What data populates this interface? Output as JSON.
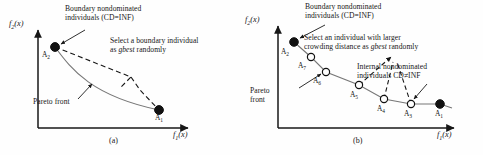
{
  "figure": {
    "kind": "two-panel-schematic-diagram",
    "width": 483,
    "height": 155,
    "background": "#ffffff",
    "ink_color": "#171717"
  },
  "panel_a": {
    "caption": "(a)",
    "axes": {
      "y_label_f": "f",
      "y_label_sub": "2",
      "y_label_arg": "(x)",
      "x_label_f": "f",
      "x_label_sub": "1",
      "x_label_arg": "(x)"
    },
    "annotations": {
      "boundary_line1": "Boundary nondominated",
      "boundary_line2": "individuals (CD=INF)",
      "select_line1": "Select a boundary individual",
      "select_line2_pre": "as ",
      "select_line2_ital": "gbest",
      "select_line2_post": " randomly",
      "pareto_front": "Pareto front"
    },
    "points": [
      {
        "id": "A2",
        "label_f": "A",
        "label_sub": "2",
        "marker": "filled",
        "x": 55,
        "y": 47
      },
      {
        "id": "A1",
        "label_f": "A",
        "label_sub": "1",
        "marker": "filled",
        "x": 159,
        "y": 110
      }
    ]
  },
  "panel_b": {
    "caption": "(b)",
    "axes": {
      "y_label_f": "f",
      "y_label_sub": "2",
      "y_label_arg": "(x)",
      "x_label_f": "f",
      "x_label_sub": "1",
      "x_label_arg": "(x)"
    },
    "annotations": {
      "boundary_line1": "Boundary nondominated",
      "boundary_line2": "individuals (CD=INF)",
      "select_line1": "Select an individual with larger",
      "select_line2_pre": "crowding distance as ",
      "select_line2_ital": "gbest",
      "select_line2_post": " randomly",
      "internal_line1": "Internal nondominated",
      "internal_line2": "individuals CD≠INF",
      "pareto_line1": "Pareto",
      "pareto_line2": "front"
    },
    "points": [
      {
        "id": "A2",
        "label_f": "A",
        "label_sub": "2",
        "marker": "filled",
        "x": 53,
        "y": 42
      },
      {
        "id": "A7",
        "label_f": "A",
        "label_sub": "7",
        "marker": "open",
        "x": 70,
        "y": 57
      },
      {
        "id": "A6",
        "label_f": "A",
        "label_sub": "6",
        "marker": "open",
        "x": 85,
        "y": 72
      },
      {
        "id": "A5",
        "label_f": "A",
        "label_sub": "5",
        "marker": "open",
        "x": 118,
        "y": 85
      },
      {
        "id": "A4",
        "label_f": "A",
        "label_sub": "4",
        "marker": "open",
        "x": 143,
        "y": 99
      },
      {
        "id": "A3",
        "label_f": "A",
        "label_sub": "3",
        "marker": "open",
        "x": 170,
        "y": 104
      },
      {
        "id": "A1",
        "label_f": "A",
        "label_sub": "1",
        "marker": "filled",
        "x": 199,
        "y": 104
      }
    ]
  }
}
